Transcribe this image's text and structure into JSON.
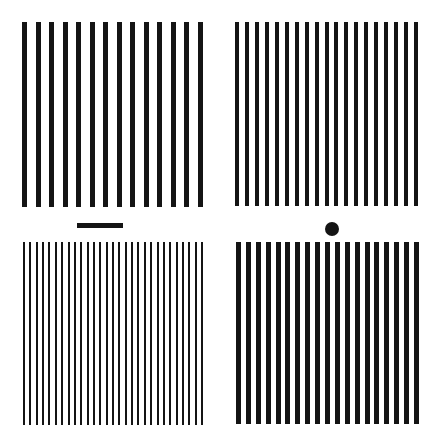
{
  "figure": {
    "background": "#ffffff",
    "ink": "#141414",
    "panels": [
      {
        "id": "top-left",
        "x": 22,
        "y": 22,
        "width": 181,
        "height": 185,
        "bars": 14,
        "bar_width": 5,
        "label": "coarse grating"
      },
      {
        "id": "top-right",
        "x": 235,
        "y": 22,
        "width": 183,
        "height": 184,
        "bars": 19,
        "bar_width": 4,
        "label": "medium grating"
      },
      {
        "id": "bottom-left",
        "x": 23,
        "y": 242,
        "width": 180,
        "height": 183,
        "bars": 29,
        "bar_width": 2,
        "label": "fine grating"
      },
      {
        "id": "bottom-right",
        "x": 236,
        "y": 242,
        "width": 183,
        "height": 182,
        "bars": 19,
        "bar_width": 5,
        "label": "medium grating"
      }
    ],
    "markers": [
      {
        "id": "dash",
        "shape": "bar",
        "x": 77,
        "y": 223,
        "width": 46,
        "height": 5
      },
      {
        "id": "dot",
        "shape": "circle",
        "cx": 332,
        "cy": 229,
        "r": 7
      }
    ]
  }
}
